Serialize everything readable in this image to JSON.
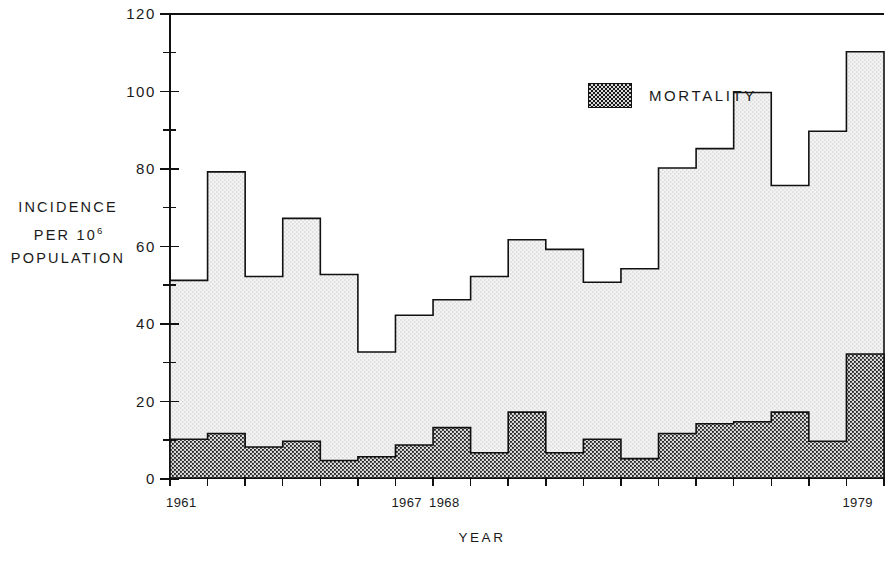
{
  "chart_data": {
    "type": "area",
    "subtype": "stacked-step",
    "title": "",
    "xlabel": "YEAR",
    "ylabel": "INCIDENCE PER 10^6 POPULATION",
    "ylabel_lines": [
      "INCIDENCE",
      "PER 10",
      "POPULATION"
    ],
    "ylabel_exponent": "6",
    "xlim": [
      1961,
      1980
    ],
    "ylim": [
      0,
      120
    ],
    "y_major_ticks": [
      0,
      20,
      40,
      60,
      80,
      100,
      120
    ],
    "y_minor_ticks": [
      10,
      30,
      50,
      70,
      90,
      110
    ],
    "y_ticklabels": [
      "0",
      "20",
      "40",
      "60",
      "80",
      "100",
      "120"
    ],
    "grid": false,
    "legend": [
      {
        "label": "MORTALITY",
        "fill": "dark-stipple"
      }
    ],
    "legend_position": "upper-center",
    "x": [
      1961,
      1962,
      1963,
      1964,
      1965,
      1966,
      1967,
      1968,
      1969,
      1970,
      1971,
      1972,
      1973,
      1974,
      1975,
      1976,
      1977,
      1978,
      1979
    ],
    "x_ticklabels_shown": [
      {
        "year": 1961,
        "label": "1961"
      },
      {
        "year": 1967,
        "label": "1967"
      },
      {
        "year": 1968,
        "label": "1968"
      },
      {
        "year": 1979,
        "label": "1979"
      }
    ],
    "series": [
      {
        "name": "INCIDENCE",
        "fill": "light-stipple",
        "values": [
          51,
          79,
          52,
          67,
          52.5,
          32.5,
          42,
          46,
          52,
          61.5,
          59,
          50.5,
          54,
          80,
          85,
          99.5,
          75.5,
          89.5,
          110
        ]
      },
      {
        "name": "MORTALITY",
        "fill": "dark-stipple",
        "values": [
          10,
          11.5,
          8,
          9.5,
          4.5,
          5.5,
          8.5,
          13,
          6.5,
          17,
          6.5,
          10,
          5,
          11.5,
          14,
          14.5,
          17,
          9.5,
          32
        ]
      }
    ]
  },
  "colors": {
    "axis": "#111111",
    "incidence_fill": "#f2f2f2",
    "mortality_fill": "#d8d8d8",
    "stipple": "#1a1a1a",
    "background": "#ffffff"
  }
}
